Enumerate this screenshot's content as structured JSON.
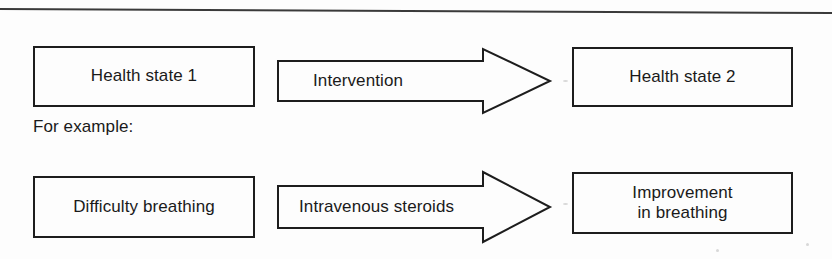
{
  "figure": {
    "background_color": "#fdfdfd",
    "line_color": "#1d1d1d",
    "text_color": "#1a1a1a"
  },
  "divider": {
    "name": "top-rule"
  },
  "row1": {
    "source_box": {
      "label": "Health state 1"
    },
    "arrow": {
      "label": "Intervention",
      "direction": "right"
    },
    "target_box": {
      "label": "Health state 2"
    }
  },
  "caption": {
    "text": "For example:"
  },
  "row2": {
    "source_box": {
      "label": "Difficulty breathing"
    },
    "arrow": {
      "label": "Intravenous steroids",
      "direction": "right"
    },
    "target_box": {
      "label_line1": "Improvement",
      "label_line2": "in breathing"
    }
  }
}
